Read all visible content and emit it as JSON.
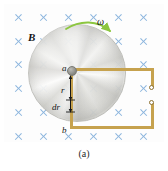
{
  "figure": {
    "caption": "(a)"
  },
  "labels": {
    "field": "B",
    "angular_velocity": "ω",
    "inner_contact": "a",
    "radius_element": "r",
    "radial_width": "dr",
    "outer_contact": "b"
  },
  "field": {
    "icon": "x-mark-into-page",
    "symbol_name": "magnetic-field-into-page",
    "color": "#8ab4dd",
    "columns": 6,
    "rows": 6,
    "x_positions": [
      18,
      43,
      68,
      93,
      118,
      143
    ],
    "y_positions": [
      17,
      41,
      64,
      88,
      112,
      136
    ]
  },
  "disk": {
    "name": "conducting-disk",
    "center_x": 76,
    "center_y": 72,
    "radius": 48,
    "fill": "#dedede"
  },
  "rotation_arrow": {
    "name": "rotation-direction-arrow",
    "color": "#8cc63f",
    "direction": "clockwise"
  },
  "circuit": {
    "wire_color": "#c6a24e",
    "terminals": 2,
    "terminal_color": "#ffffff",
    "terminal_border": "#8a7030"
  }
}
